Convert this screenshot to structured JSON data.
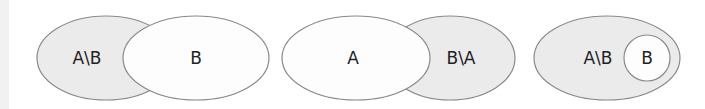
{
  "colors": {
    "shaded_fill": "#ebebeb",
    "plain_fill": "#fdfdfd",
    "outline": "#8a8a8a",
    "text": "#222222"
  },
  "diagrams": [
    {
      "name": "set-difference-a-minus-b",
      "shaded_set_label": "A\\B",
      "other_set_label": "B"
    },
    {
      "name": "set-difference-b-minus-a",
      "plain_set_label": "A",
      "shaded_set_label": "B\\A"
    },
    {
      "name": "set-difference-b-subset-of-a",
      "shaded_set_label": "A\\B",
      "inner_set_label": "B"
    }
  ]
}
